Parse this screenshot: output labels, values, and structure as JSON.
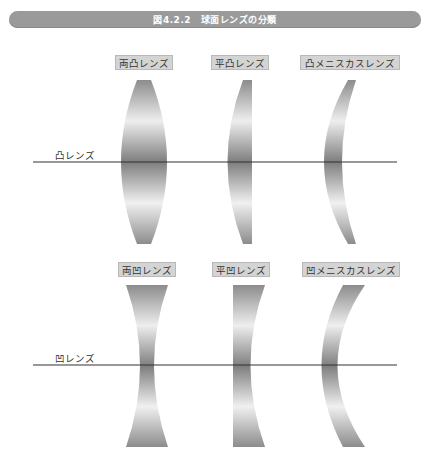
{
  "title": "図4.2.2　球面レンズの分類",
  "convex": {
    "row_label": "凸レンズ",
    "lenses": [
      {
        "label": "両凸レンズ"
      },
      {
        "label": "平凸レンズ"
      },
      {
        "label": "凸メニスカスレンズ"
      }
    ]
  },
  "concave": {
    "row_label": "凹レンズ",
    "lenses": [
      {
        "label": "両凹レンズ"
      },
      {
        "label": "平凹レンズ"
      },
      {
        "label": "凹メニスカスレンズ"
      }
    ]
  },
  "colors": {
    "title_bar": "#9a9a9a",
    "label_bg": "#d4d4d4",
    "axis": "#333333",
    "lens_dark": "#8a8a8a",
    "lens_light": "#f2f2f2"
  }
}
